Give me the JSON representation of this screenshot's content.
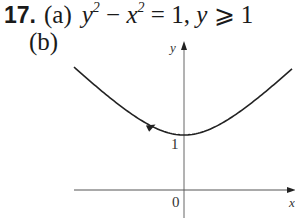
{
  "problem": {
    "number": "17.",
    "part_a": {
      "label": "(a)",
      "equation": {
        "y": "y",
        "exp1": "2",
        "minus": " − ",
        "x": "x",
        "exp2": "2",
        "equals": " = 1, ",
        "y2": "y",
        "geq": " ⩾ 1"
      }
    },
    "part_b": {
      "label": "(b)"
    }
  },
  "chart_data": {
    "type": "line",
    "title": "",
    "equation": "y^2 - x^2 = 1, y >= 1",
    "xlabel": "x",
    "ylabel": "y",
    "tick_labels": {
      "origin": "0",
      "y_tick": "1"
    },
    "x": [
      -2,
      -1.5,
      -1,
      -0.5,
      0,
      0.5,
      1,
      1.5,
      2
    ],
    "y": [
      2.236,
      1.803,
      1.414,
      1.118,
      1,
      1.118,
      1.414,
      1.803,
      2.236
    ],
    "direction_arrow": "left branch, pointing toward vertex (increasing x)",
    "grid": false,
    "legend": "none",
    "colors": {
      "curve": "#222222",
      "axes": "#555555"
    }
  }
}
